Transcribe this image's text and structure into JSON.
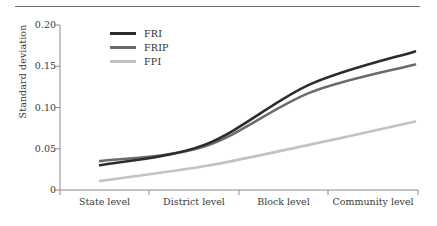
{
  "chart_data": {
    "type": "line",
    "title": "",
    "subtitle": "",
    "xlabel": "",
    "ylabel": "Standard deviation",
    "categories": [
      "State level",
      "District level",
      "Block level",
      "Community level"
    ],
    "ylim": [
      0,
      0.2
    ],
    "yticks": [
      0,
      0.05,
      0.1,
      0.15,
      0.2
    ],
    "ytick_labels": [
      "0",
      "0.05",
      "0.10",
      "0.15",
      "0.20"
    ],
    "grid": false,
    "legend_position": "top-left",
    "interpolation": "smooth",
    "series": [
      {
        "name": "FRI",
        "color": "#2b2b2b",
        "values": [
          0.03,
          0.055,
          0.128,
          0.168
        ]
      },
      {
        "name": "FRIP",
        "color": "#6b6b6b",
        "values": [
          0.035,
          0.053,
          0.118,
          0.152
        ]
      },
      {
        "name": "FPI",
        "color": "#c2c2c2",
        "values": [
          0.011,
          0.029,
          0.055,
          0.083
        ]
      }
    ]
  },
  "axes": {
    "ylabel": "Standard deviation",
    "ytick_labels": [
      "0.20",
      "0.15",
      "0.10",
      "0.05",
      "0"
    ],
    "xtick_labels": [
      "State level",
      "District level",
      "Block level",
      "Community level"
    ]
  },
  "legend": {
    "items": [
      {
        "label": "FRI",
        "color": "#2b2b2b"
      },
      {
        "label": "FRIP",
        "color": "#6b6b6b"
      },
      {
        "label": "FPI",
        "color": "#c2c2c2"
      }
    ]
  },
  "colors": {
    "axis": "#8a8a8a",
    "rule": "#6e6e6e",
    "text": "#3a3a3a"
  }
}
